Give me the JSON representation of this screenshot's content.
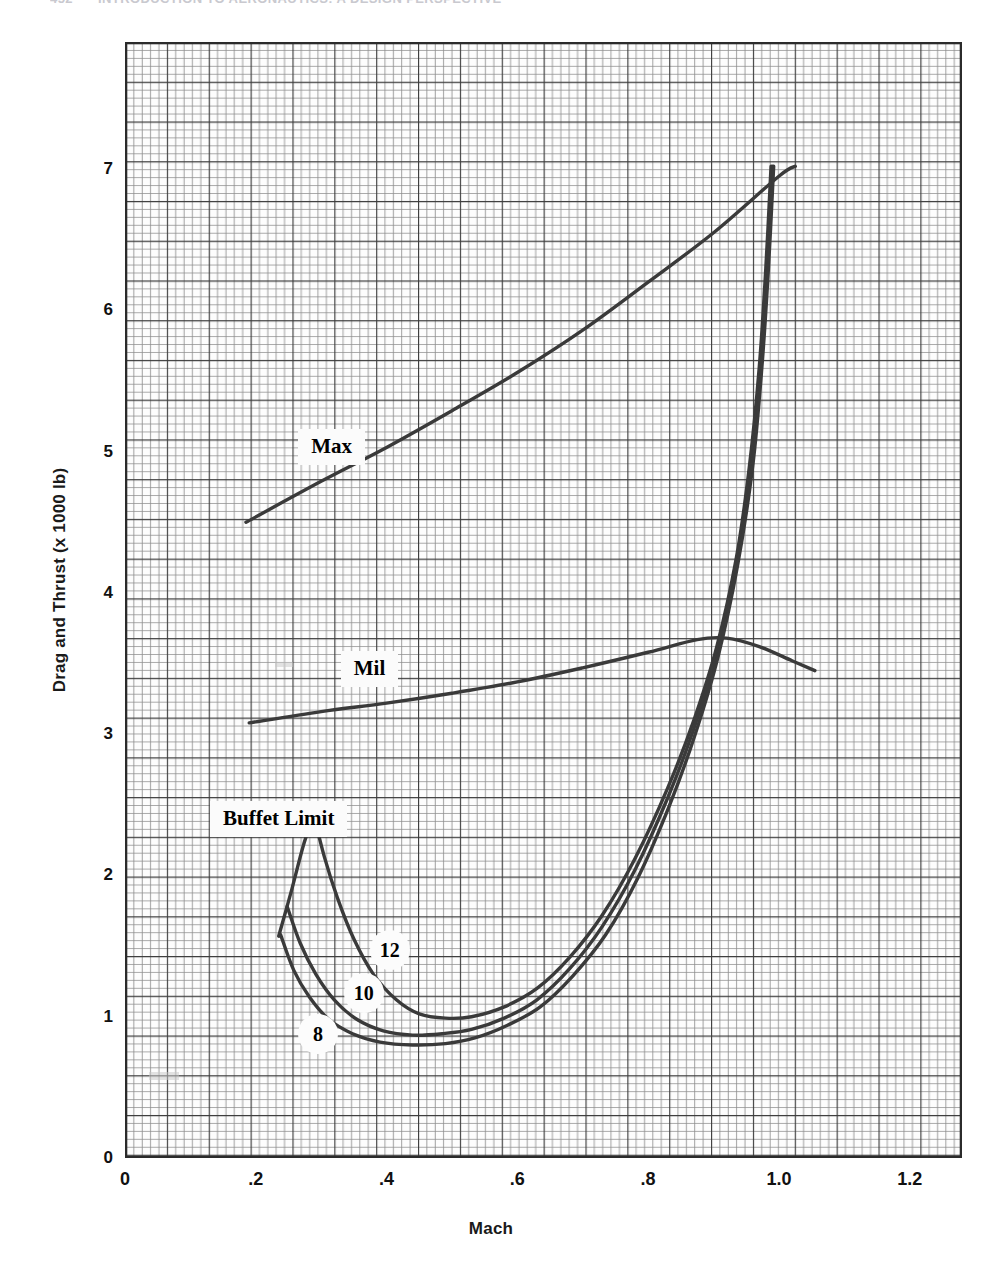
{
  "page": {
    "running_header_page": "452",
    "running_header_text": "INTRODUCTION TO AERONAUTICS: A DESIGN PERSPECTIVE"
  },
  "chart_data": {
    "type": "line",
    "title": "",
    "xlabel": "Mach",
    "ylabel": "Drag and Thrust (x 1000 lb)",
    "xlim": [
      0,
      1.28
    ],
    "ylim": [
      0,
      7.9
    ],
    "xticks": [
      "0",
      ".2",
      ".4",
      ".6",
      ".8",
      "1.0",
      "1.2"
    ],
    "xtick_values": [
      0,
      0.2,
      0.4,
      0.6,
      0.8,
      1.0,
      1.2
    ],
    "yticks": [
      "0",
      "1",
      "2",
      "3",
      "4",
      "5",
      "6",
      "7"
    ],
    "ytick_values": [
      0,
      1,
      2,
      3,
      4,
      5,
      6,
      7
    ],
    "grid": "graph-paper minor every 0.02 Mach / 0.05 thrust, major every 0.1 Mach / 0.25 thrust",
    "legend_position": "inline-labels",
    "series": [
      {
        "name": "Max",
        "label": "Max",
        "label_x": 0.265,
        "label_y": 5.03,
        "points": [
          [
            0.185,
            4.5
          ],
          [
            0.3,
            4.79
          ],
          [
            0.4,
            5.03
          ],
          [
            0.5,
            5.29
          ],
          [
            0.6,
            5.56
          ],
          [
            0.7,
            5.86
          ],
          [
            0.8,
            6.2
          ],
          [
            0.9,
            6.55
          ],
          [
            1.0,
            6.95
          ],
          [
            1.025,
            7.02
          ]
        ]
      },
      {
        "name": "Mil",
        "label": "Mil",
        "label_x": 0.33,
        "label_y": 3.46,
        "points": [
          [
            0.19,
            3.08
          ],
          [
            0.3,
            3.16
          ],
          [
            0.4,
            3.22
          ],
          [
            0.5,
            3.29
          ],
          [
            0.6,
            3.37
          ],
          [
            0.7,
            3.47
          ],
          [
            0.8,
            3.58
          ],
          [
            0.875,
            3.67
          ],
          [
            0.92,
            3.68
          ],
          [
            0.97,
            3.62
          ],
          [
            1.02,
            3.52
          ],
          [
            1.055,
            3.45
          ]
        ]
      },
      {
        "name": "Buffet Limit",
        "label": "Buffet Limit",
        "label_x": 0.13,
        "label_y": 2.4,
        "points": [
          [
            0.235,
            1.57
          ],
          [
            0.255,
            1.9
          ],
          [
            0.272,
            2.2
          ],
          [
            0.285,
            2.38
          ],
          [
            0.292,
            2.46
          ]
        ]
      },
      {
        "name": "Drag n=12",
        "label": "12",
        "label_x": 0.405,
        "label_y": 1.47,
        "points": [
          [
            0.288,
            2.44
          ],
          [
            0.305,
            2.13
          ],
          [
            0.325,
            1.84
          ],
          [
            0.35,
            1.55
          ],
          [
            0.38,
            1.3
          ],
          [
            0.415,
            1.12
          ],
          [
            0.45,
            1.02
          ],
          [
            0.49,
            0.99
          ],
          [
            0.53,
            1.0
          ],
          [
            0.58,
            1.07
          ],
          [
            0.63,
            1.2
          ],
          [
            0.68,
            1.42
          ],
          [
            0.73,
            1.72
          ],
          [
            0.78,
            2.12
          ],
          [
            0.83,
            2.62
          ],
          [
            0.87,
            3.1
          ],
          [
            0.905,
            3.62
          ],
          [
            0.935,
            4.25
          ],
          [
            0.955,
            4.9
          ],
          [
            0.97,
            5.6
          ],
          [
            0.98,
            6.3
          ],
          [
            0.988,
            7.02
          ]
        ]
      },
      {
        "name": "Drag n=10",
        "label": "10",
        "label_x": 0.365,
        "label_y": 1.17,
        "points": [
          [
            0.248,
            1.78
          ],
          [
            0.268,
            1.52
          ],
          [
            0.292,
            1.3
          ],
          [
            0.32,
            1.12
          ],
          [
            0.355,
            0.98
          ],
          [
            0.395,
            0.9
          ],
          [
            0.44,
            0.87
          ],
          [
            0.485,
            0.88
          ],
          [
            0.53,
            0.91
          ],
          [
            0.58,
            0.99
          ],
          [
            0.63,
            1.12
          ],
          [
            0.68,
            1.34
          ],
          [
            0.73,
            1.64
          ],
          [
            0.78,
            2.04
          ],
          [
            0.83,
            2.55
          ],
          [
            0.87,
            3.04
          ],
          [
            0.905,
            3.58
          ],
          [
            0.935,
            4.22
          ],
          [
            0.958,
            4.9
          ],
          [
            0.972,
            5.6
          ],
          [
            0.982,
            6.3
          ],
          [
            0.99,
            7.02
          ]
        ]
      },
      {
        "name": "Drag n=8",
        "label": "8",
        "label_x": 0.295,
        "label_y": 0.88,
        "points": [
          [
            0.238,
            1.58
          ],
          [
            0.258,
            1.33
          ],
          [
            0.282,
            1.14
          ],
          [
            0.312,
            0.98
          ],
          [
            0.348,
            0.88
          ],
          [
            0.39,
            0.82
          ],
          [
            0.44,
            0.8
          ],
          [
            0.49,
            0.81
          ],
          [
            0.535,
            0.85
          ],
          [
            0.585,
            0.94
          ],
          [
            0.635,
            1.07
          ],
          [
            0.685,
            1.29
          ],
          [
            0.735,
            1.58
          ],
          [
            0.785,
            1.99
          ],
          [
            0.833,
            2.5
          ],
          [
            0.872,
            3.0
          ],
          [
            0.907,
            3.55
          ],
          [
            0.937,
            4.2
          ],
          [
            0.96,
            4.9
          ],
          [
            0.974,
            5.6
          ],
          [
            0.984,
            6.3
          ],
          [
            0.992,
            7.02
          ]
        ]
      }
    ],
    "annotations": [
      {
        "text": "Max",
        "kind": "box"
      },
      {
        "text": "Mil",
        "kind": "box"
      },
      {
        "text": "Buffet Limit",
        "kind": "box"
      },
      {
        "text": "12",
        "kind": "circle"
      },
      {
        "text": "10",
        "kind": "circle"
      },
      {
        "text": "8",
        "kind": "circle"
      }
    ],
    "colors": {
      "curve": "#3a3a3a",
      "grid_minor": "#9a9a9a",
      "grid_major": "#4a4a4a",
      "text": "#111111",
      "background": "#ffffff"
    }
  }
}
